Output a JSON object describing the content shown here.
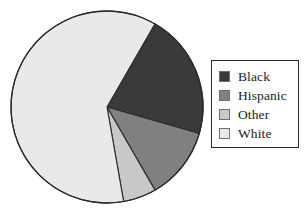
{
  "chart_data": {
    "type": "pie",
    "title": "",
    "subtitle": "",
    "xlabel": "",
    "ylabel": "",
    "grid": false,
    "legend_position": "right",
    "start_angle_deg": 30,
    "direction": "clockwise",
    "categories": [
      "Black",
      "Hispanic",
      "Other",
      "White"
    ],
    "values": [
      21,
      12,
      6,
      61
    ],
    "value_unit": "percent",
    "slices": [
      {
        "label": "Black",
        "value": 21,
        "percent": 21,
        "color": "#3a3a3a",
        "start_angle_deg": 30,
        "end_angle_deg": 106
      },
      {
        "label": "Hispanic",
        "value": 12,
        "percent": 12,
        "color": "#808080",
        "start_angle_deg": 106,
        "end_angle_deg": 150
      },
      {
        "label": "Other",
        "value": 6,
        "percent": 6,
        "color": "#c8c8c8",
        "start_angle_deg": 150,
        "end_angle_deg": 170
      },
      {
        "label": "White",
        "value": 61,
        "percent": 61,
        "color": "#e9e9e7",
        "start_angle_deg": 170,
        "end_angle_deg": 390
      }
    ]
  },
  "legend": {
    "items": [
      {
        "label": "Black",
        "color": "#3a3a3a"
      },
      {
        "label": "Hispanic",
        "color": "#808080"
      },
      {
        "label": "Other",
        "color": "#c8c8c8"
      },
      {
        "label": "White",
        "color": "#e9e9e7"
      }
    ]
  },
  "style": {
    "slice_outline": "#2a2a2a",
    "legend_border": "#2a2a2a",
    "background": "#ffffff",
    "text_color": "#1c1c1c"
  },
  "geometry": {
    "center_x": 107,
    "center_y": 107,
    "radius": 96
  }
}
